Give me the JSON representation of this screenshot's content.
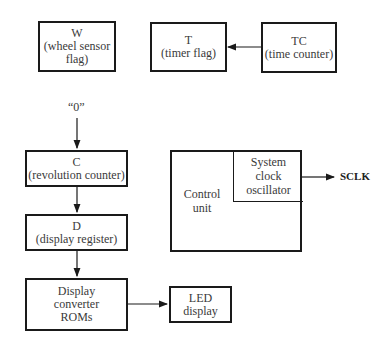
{
  "blocks": {
    "w": {
      "title": "W",
      "lines": [
        "(wheel sensor",
        "flag)"
      ]
    },
    "t": {
      "title": "T",
      "lines": [
        "(timer flag)"
      ]
    },
    "tc": {
      "title": "TC",
      "lines": [
        "(time counter)"
      ]
    },
    "c": {
      "title": "C",
      "lines": [
        "(revolution counter)"
      ]
    },
    "d": {
      "title": "D",
      "lines": [
        "(display register)"
      ]
    },
    "roms": {
      "lines": [
        "Display",
        "converter",
        "ROMs"
      ]
    },
    "led": {
      "lines": [
        "LED",
        "display"
      ]
    },
    "control_unit": {
      "lines": [
        "Control",
        "unit"
      ]
    },
    "clock": {
      "lines": [
        "System",
        "clock",
        "oscillator"
      ]
    }
  },
  "labels": {
    "zero_input": "“0”",
    "sclk": "SCLK"
  },
  "connections": [
    {
      "from": "tc",
      "to": "t"
    },
    {
      "from": "zero_input",
      "to": "c"
    },
    {
      "from": "c",
      "to": "d"
    },
    {
      "from": "d",
      "to": "roms"
    },
    {
      "from": "roms",
      "to": "led"
    },
    {
      "from": "clock",
      "to": "sclk"
    }
  ]
}
